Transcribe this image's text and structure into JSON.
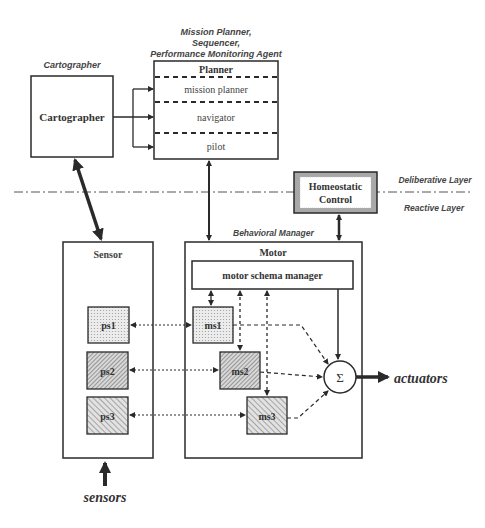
{
  "annotations": {
    "cartographer_caption": "Cartographer",
    "planner_caption_line1": "Mission Planner,",
    "planner_caption_line2": "Sequencer,",
    "planner_caption_line3": "Performance Monitoring Agent",
    "behavioral_manager_caption": "Behavioral Manager",
    "deliberative_layer": "Deliberative Layer",
    "reactive_layer": "Reactive Layer"
  },
  "cartographer": {
    "label": "Cartographer"
  },
  "planner": {
    "title": "Planner",
    "sections": [
      "mission planner",
      "navigator",
      "pilot"
    ]
  },
  "homeostatic": {
    "line1": "Homeostatic",
    "line2": "Control"
  },
  "sensor": {
    "title": "Sensor",
    "schemas": [
      "ps1",
      "ps2",
      "ps3"
    ]
  },
  "motor": {
    "title": "Motor",
    "manager": "motor schema manager",
    "schemas": [
      "ms1",
      "ms2",
      "ms3"
    ]
  },
  "summation": {
    "symbol": "Σ"
  },
  "io": {
    "actuators": "actuators",
    "sensors": "sensors"
  },
  "colors": {
    "stroke": "#2a2a2a",
    "gray_border": "#a8a8a8",
    "text": "#333333"
  }
}
